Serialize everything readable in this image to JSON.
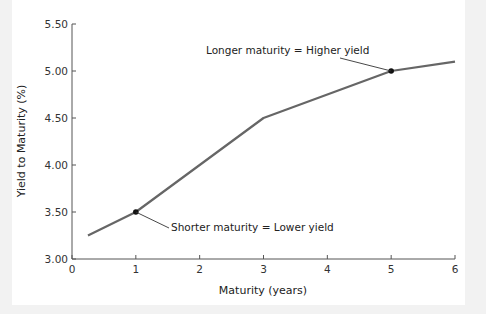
{
  "chart_data": {
    "type": "line",
    "title": "",
    "xlabel": "Maturity (years)",
    "ylabel": "Yield to Maturity (%)",
    "xlim": [
      0,
      6
    ],
    "ylim": [
      3.0,
      5.5
    ],
    "x_ticks": [
      "0",
      "1",
      "2",
      "3",
      "4",
      "5",
      "6"
    ],
    "y_ticks": [
      "3.00",
      "3.50",
      "4.00",
      "4.50",
      "5.00",
      "5.50"
    ],
    "grid": false,
    "legend": null,
    "series": [
      {
        "name": "Yield curve",
        "color": "#666666",
        "x": [
          0.25,
          1,
          3,
          5,
          6
        ],
        "y": [
          3.25,
          3.5,
          4.5,
          5.0,
          5.1
        ]
      }
    ],
    "highlighted_points": [
      {
        "x": 1,
        "y": 3.5
      },
      {
        "x": 5,
        "y": 5.0
      }
    ],
    "annotations": [
      {
        "text": "Longer maturity = Higher yield",
        "points_to": {
          "x": 5,
          "y": 5.0
        }
      },
      {
        "text": "Shorter maturity = Lower yield",
        "points_to": {
          "x": 1,
          "y": 3.5
        }
      }
    ]
  },
  "colors": {
    "line": "#666666",
    "axis": "#555555",
    "marker": "#111111",
    "background": "#ffffff",
    "outer_background": "#f2f2f2"
  }
}
